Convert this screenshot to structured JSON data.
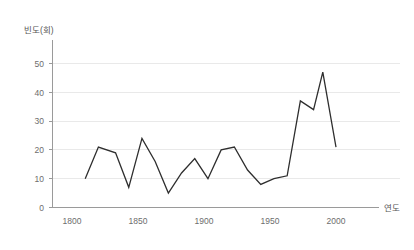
{
  "chart_data": {
    "type": "line",
    "title": "",
    "ylabel": "빈도(회)",
    "xlabel": "연도",
    "xlim": [
      1805,
      2005
    ],
    "ylim": [
      0,
      55
    ],
    "grid": true,
    "legend": "none",
    "y_ticks": [
      "0",
      "10",
      "20",
      "30",
      "40",
      "50"
    ],
    "y_tick_values": [
      0,
      10,
      20,
      30,
      40,
      50
    ],
    "x_ticks": [
      "1800",
      "1850",
      "1900",
      "1950",
      "2000"
    ],
    "x_tick_values": [
      1800,
      1850,
      1900,
      1950,
      2000
    ],
    "x": [
      1810,
      1820,
      1833,
      1843,
      1853,
      1863,
      1873,
      1883,
      1893,
      1903,
      1913,
      1923,
      1933,
      1943,
      1953,
      1963,
      1973,
      1983,
      1990,
      2000
    ],
    "values": [
      10,
      21,
      19,
      7,
      24,
      16,
      5,
      12,
      17,
      10,
      20,
      21,
      13,
      8,
      10,
      11,
      37,
      34,
      47,
      21
    ],
    "series": [
      {
        "name": "빈도",
        "color": "#2e2e2e",
        "values": [
          10,
          21,
          19,
          7,
          24,
          16,
          5,
          12,
          17,
          10,
          20,
          21,
          13,
          8,
          10,
          11,
          37,
          34,
          47,
          21
        ]
      }
    ]
  },
  "axes": {
    "y_axis_title": "빈도(회)",
    "x_axis_title": "연도"
  }
}
